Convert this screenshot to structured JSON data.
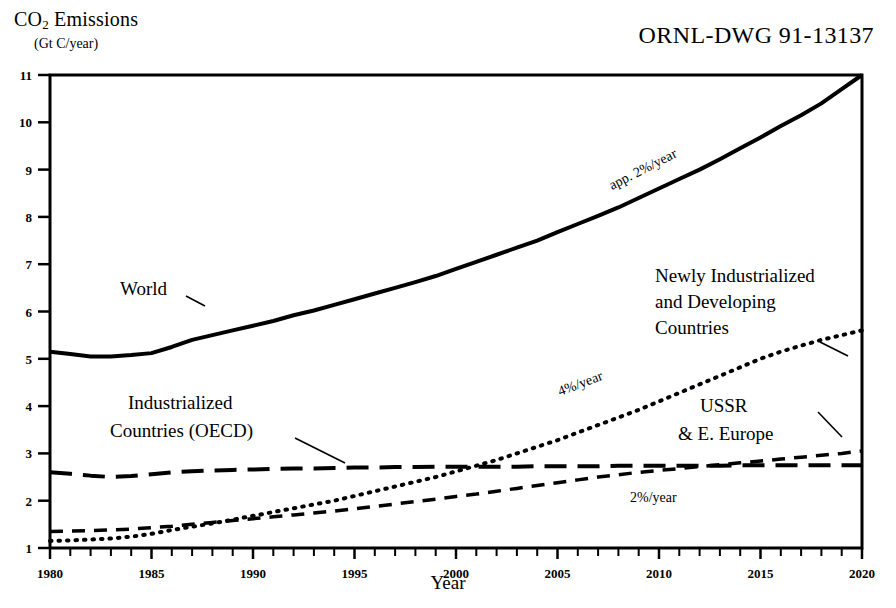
{
  "header": {
    "y_axis_title": "CO",
    "y_axis_title_sub": "2",
    "y_axis_title_rest": " Emissions",
    "y_axis_units": "(Gt C/year)",
    "drawing_code": "ORNL-DWG 91-13137",
    "x_axis_title": "Year"
  },
  "chart_data": {
    "type": "line",
    "title": "CO2 Emissions (Gt C/year)",
    "xlabel": "Year",
    "ylabel": "CO2 Emissions (Gt C/year)",
    "xlim": [
      1980,
      2020
    ],
    "ylim": [
      1,
      11
    ],
    "grid": false,
    "legend": "inline-annotations",
    "x_ticks_major": [
      1980,
      1985,
      1990,
      1995,
      2000,
      2005,
      2010,
      2015,
      2020
    ],
    "x_tick_labels": [
      "1980",
      "1985",
      "1990",
      "1995",
      "2000",
      "2005",
      "2010",
      "2015",
      "2020"
    ],
    "x_tick_minor_step": 1,
    "y_ticks": [
      1,
      2,
      3,
      4,
      5,
      6,
      7,
      8,
      9,
      10,
      11
    ],
    "y_tick_labels": [
      "1",
      "2",
      "3",
      "4",
      "5",
      "6",
      "7",
      "8",
      "9",
      "10",
      "11"
    ],
    "x": [
      1980,
      1981,
      1982,
      1983,
      1984,
      1985,
      1986,
      1987,
      1988,
      1989,
      1990,
      1991,
      1992,
      1993,
      1994,
      1995,
      1996,
      1997,
      1998,
      1999,
      2000,
      2001,
      2002,
      2003,
      2004,
      2005,
      2006,
      2007,
      2008,
      2009,
      2010,
      2011,
      2012,
      2013,
      2014,
      2015,
      2016,
      2017,
      2018,
      2019,
      2020
    ],
    "series": [
      {
        "name": "World",
        "style": "solid",
        "width": 4,
        "label": "World",
        "rate_label": "app. 2%/year",
        "values": [
          5.15,
          5.1,
          5.05,
          5.05,
          5.08,
          5.12,
          5.25,
          5.4,
          5.5,
          5.6,
          5.7,
          5.8,
          5.92,
          6.02,
          6.14,
          6.26,
          6.38,
          6.5,
          6.62,
          6.75,
          6.9,
          7.05,
          7.2,
          7.35,
          7.5,
          7.68,
          7.85,
          8.02,
          8.2,
          8.4,
          8.6,
          8.8,
          9.0,
          9.22,
          9.45,
          9.68,
          9.92,
          10.15,
          10.4,
          10.7,
          11.0
        ]
      },
      {
        "name": "Newly Industrialized and Developing Countries",
        "style": "dotted",
        "width": 4,
        "label": "Newly Industrialized\nand Developing\nCountries",
        "rate_label": "4%/year",
        "values": [
          1.15,
          1.16,
          1.18,
          1.2,
          1.24,
          1.3,
          1.38,
          1.45,
          1.52,
          1.6,
          1.68,
          1.76,
          1.84,
          1.92,
          2.0,
          2.1,
          2.2,
          2.3,
          2.4,
          2.5,
          2.62,
          2.74,
          2.86,
          3.0,
          3.14,
          3.28,
          3.44,
          3.6,
          3.76,
          3.92,
          4.1,
          4.28,
          4.46,
          4.64,
          4.82,
          5.0,
          5.15,
          5.28,
          5.4,
          5.5,
          5.6
        ]
      },
      {
        "name": "Industrialized Countries (OECD)",
        "style": "long-dash",
        "width": 4,
        "label": "Industrialized\nCountries (OECD)",
        "values": [
          2.6,
          2.57,
          2.53,
          2.5,
          2.52,
          2.56,
          2.6,
          2.62,
          2.64,
          2.65,
          2.66,
          2.67,
          2.68,
          2.68,
          2.69,
          2.7,
          2.7,
          2.71,
          2.71,
          2.72,
          2.72,
          2.72,
          2.72,
          2.72,
          2.73,
          2.73,
          2.73,
          2.73,
          2.74,
          2.74,
          2.74,
          2.74,
          2.74,
          2.74,
          2.75,
          2.75,
          2.75,
          2.75,
          2.75,
          2.75,
          2.75
        ]
      },
      {
        "name": "USSR & E. Europe",
        "style": "dash",
        "width": 3.5,
        "label": "USSR\n& E. Europe",
        "rate_label": "2%/year",
        "values": [
          1.35,
          1.36,
          1.37,
          1.38,
          1.4,
          1.43,
          1.46,
          1.5,
          1.54,
          1.58,
          1.62,
          1.66,
          1.7,
          1.74,
          1.78,
          1.83,
          1.88,
          1.93,
          1.98,
          2.03,
          2.09,
          2.14,
          2.2,
          2.26,
          2.32,
          2.38,
          2.44,
          2.5,
          2.55,
          2.6,
          2.64,
          2.68,
          2.72,
          2.76,
          2.8,
          2.84,
          2.88,
          2.92,
          2.96,
          3.0,
          3.05
        ]
      }
    ],
    "annotations": [
      {
        "name": "world-label",
        "text": "World",
        "x_px": 120,
        "y_px": 295
      },
      {
        "name": "world-rate",
        "text": "app. 2%/year",
        "x_px": 612,
        "y_px": 190,
        "rotation": -27
      },
      {
        "name": "developing-label-line1",
        "text": "Newly Industrialized",
        "x_px": 655,
        "y_px": 282
      },
      {
        "name": "developing-label-line2",
        "text": "and Developing",
        "x_px": 655,
        "y_px": 308
      },
      {
        "name": "developing-label-line3",
        "text": "Countries",
        "x_px": 655,
        "y_px": 334
      },
      {
        "name": "developing-rate",
        "text": "4%/year",
        "x_px": 560,
        "y_px": 396,
        "rotation": -21
      },
      {
        "name": "oecd-label-line1",
        "text": "Industrialized",
        "x_px": 128,
        "y_px": 409
      },
      {
        "name": "oecd-label-line2",
        "text": "Countries (OECD)",
        "x_px": 110,
        "y_px": 437
      },
      {
        "name": "ussr-label-line1",
        "text": "USSR",
        "x_px": 700,
        "y_px": 412
      },
      {
        "name": "ussr-label-line2",
        "text": "& E. Europe",
        "x_px": 678,
        "y_px": 440
      },
      {
        "name": "ussr-rate",
        "text": "2%/year",
        "x_px": 630,
        "y_px": 502
      }
    ]
  }
}
